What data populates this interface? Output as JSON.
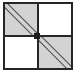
{
  "figure": {
    "width": 76,
    "height": 73,
    "background_color": "#ffffff",
    "border_color": "#262626",
    "shade_color": "#d3d3d3",
    "hatch_color": "#4d4d4d",
    "center_node_color": "#1c1c1c",
    "rows": 2,
    "columns": 2,
    "caption": ""
  },
  "cells": [
    {
      "id": "cell-r0c0",
      "row": 0,
      "column": 0,
      "position": "top-left",
      "fill": "shaded",
      "pattern": "double-diagonal",
      "diagonal_direction": "top-left-to-bottom-right",
      "label": ""
    },
    {
      "id": "cell-r0c1",
      "row": 0,
      "column": 1,
      "position": "top-right",
      "fill": "empty",
      "pattern": "none",
      "diagonal_direction": "",
      "label": ""
    },
    {
      "id": "cell-r1c0",
      "row": 1,
      "column": 0,
      "position": "bottom-left",
      "fill": "empty",
      "pattern": "none",
      "diagonal_direction": "",
      "label": ""
    },
    {
      "id": "cell-r1c1",
      "row": 1,
      "column": 1,
      "position": "bottom-right",
      "fill": "shaded",
      "pattern": "double-diagonal",
      "diagonal_direction": "top-left-to-bottom-right",
      "label": ""
    }
  ]
}
